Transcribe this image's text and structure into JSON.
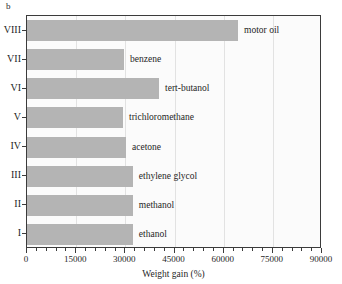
{
  "panel": {
    "label": "b"
  },
  "chart_data": {
    "type": "bar",
    "orientation": "horizontal",
    "title": "",
    "subtitle": "",
    "xlabel": "Weight gain (%)",
    "ylabel": "",
    "xlim": [
      0,
      90000
    ],
    "ylim": null,
    "grid": "vertical-light",
    "legend": "none",
    "bar_color": "#b4b4b4",
    "categories": [
      "I",
      "II",
      "III",
      "IV",
      "V",
      "VI",
      "VII",
      "VIII"
    ],
    "annotations": [
      "ethanol",
      "methanol",
      "ethylene glycol",
      "acetone",
      "trichloromethane",
      "tert-butanol",
      "benzene",
      "motor oil"
    ],
    "values": [
      32300,
      32300,
      32300,
      30200,
      29300,
      40300,
      29600,
      64400
    ],
    "xticks": [
      0,
      15000,
      30000,
      45000,
      60000,
      75000,
      90000
    ],
    "xtick_labels": [
      "0",
      "15000",
      "30000",
      "45000",
      "60000",
      "75000",
      "90000"
    ],
    "minor_ticks_per_interval": 4,
    "bars": [
      {
        "category": "VIII",
        "label": "motor oil",
        "value": 64400
      },
      {
        "category": "VII",
        "label": "benzene",
        "value": 29600
      },
      {
        "category": "VI",
        "label": "tert-butanol",
        "value": 40300
      },
      {
        "category": "V",
        "label": "trichloromethane",
        "value": 29300
      },
      {
        "category": "IV",
        "label": "acetone",
        "value": 30200
      },
      {
        "category": "III",
        "label": "ethylene glycol",
        "value": 32300
      },
      {
        "category": "II",
        "label": "methanol",
        "value": 32300
      },
      {
        "category": "I",
        "label": "ethanol",
        "value": 32300
      }
    ]
  }
}
